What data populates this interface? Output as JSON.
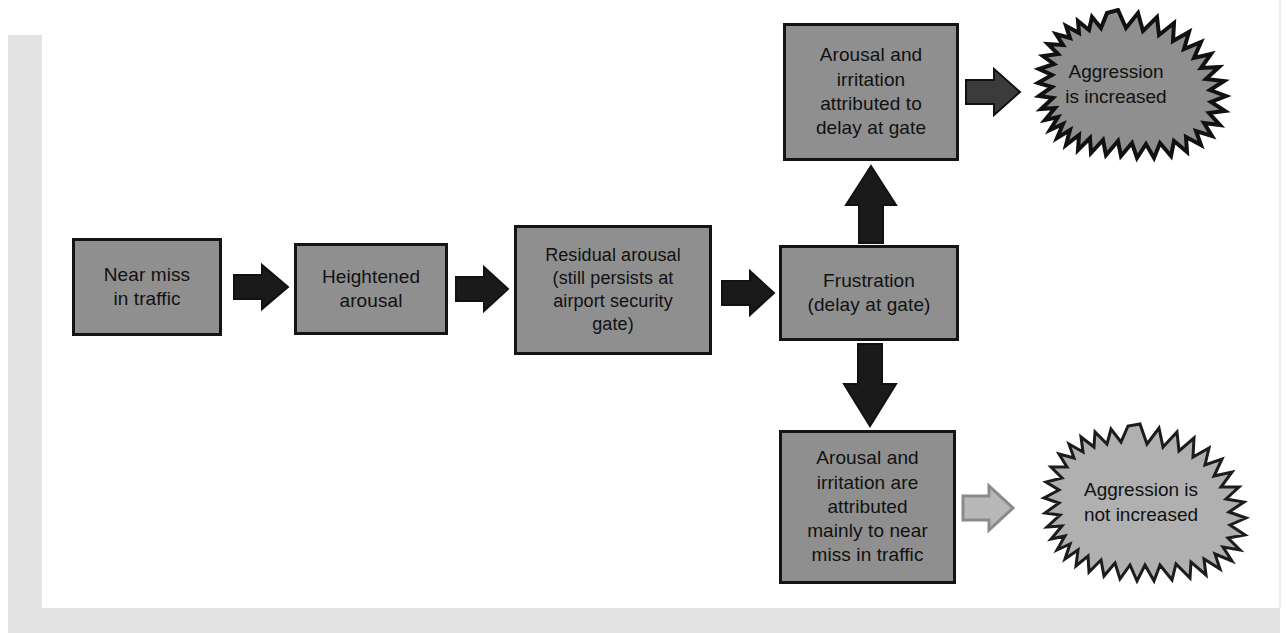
{
  "diagram": {
    "colors": {
      "box_fill": "#8f8f8f",
      "box_border": "#141414",
      "arrow_solid": "#1a1a1a",
      "arrow_outline": "#b3b3b3",
      "burst_increased_fill": "#8f8f8f",
      "burst_not_increased_fill": "#b0b0b0",
      "page_band": "#e3e3e3",
      "background": "#ffffff"
    },
    "nodes": [
      {
        "id": "near-miss",
        "label": "Near miss\nin traffic"
      },
      {
        "id": "heightened",
        "label": "Heightened\narousal"
      },
      {
        "id": "residual",
        "label": "Residual arousal\n(still persists at\nairport security\ngate)"
      },
      {
        "id": "frustration",
        "label": "Frustration\n(delay at gate)"
      },
      {
        "id": "attr-gate",
        "label": "Arousal and\nirritation\nattributed to\ndelay at gate"
      },
      {
        "id": "attr-near-miss",
        "label": "Arousal and\nirritation are\nattributed\nmainly to near\nmiss in traffic"
      }
    ],
    "outcomes": [
      {
        "id": "aggression-increased",
        "label": "Aggression\nis increased",
        "style": "solid-burst"
      },
      {
        "id": "aggression-not-increased",
        "label": "Aggression is\nnot increased",
        "style": "light-burst"
      }
    ],
    "arrows": [
      {
        "id": "near-miss-to-heightened",
        "direction": "right",
        "style": "solid"
      },
      {
        "id": "heightened-to-residual",
        "direction": "right",
        "style": "solid"
      },
      {
        "id": "residual-to-frustration",
        "direction": "right",
        "style": "solid"
      },
      {
        "id": "frustration-to-attr-gate",
        "direction": "up",
        "style": "solid"
      },
      {
        "id": "frustration-to-attr-near-miss",
        "direction": "down",
        "style": "solid"
      },
      {
        "id": "attr-gate-to-aggression",
        "direction": "right",
        "style": "solid"
      },
      {
        "id": "attr-near-miss-to-no-aggression",
        "direction": "right",
        "style": "outline"
      }
    ]
  }
}
